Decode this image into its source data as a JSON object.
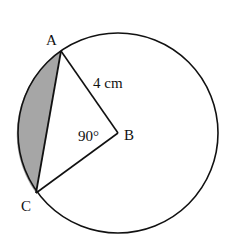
{
  "diagram": {
    "type": "circle-sector-segment",
    "circle": {
      "center_label": "B",
      "cx": 118,
      "cy": 133,
      "r": 100
    },
    "points": {
      "A": {
        "label": "A",
        "x": 61,
        "y": 51,
        "label_x": 46,
        "label_y": 45
      },
      "B": {
        "label": "B",
        "x": 118,
        "y": 133,
        "label_x": 124,
        "label_y": 140
      },
      "C": {
        "label": "C",
        "x": 36,
        "y": 193,
        "label_x": 21,
        "label_y": 211
      }
    },
    "radius_label": "4 cm",
    "angle_label": "90°",
    "shaded_region": "minor segment between chord AC and arc AC",
    "colors": {
      "line": "#111111",
      "shade": "#a6a6a6",
      "background": "#ffffff"
    }
  }
}
